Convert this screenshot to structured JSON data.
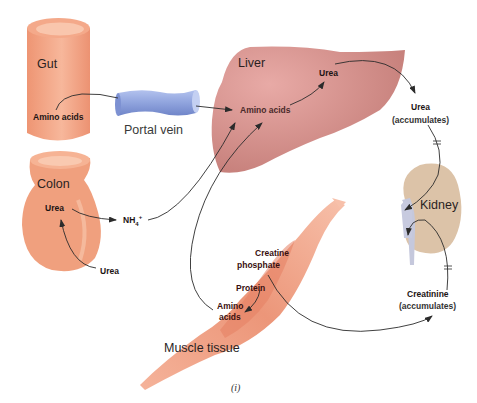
{
  "organs": {
    "gut": "Gut",
    "colon": "Colon",
    "liver": "Liver",
    "kidney": "Kidney",
    "muscle": "Muscle tissue",
    "portal_vein": "Portal vein"
  },
  "labels": {
    "gut_amino_acids": "Amino acids",
    "colon_urea": "Urea",
    "urea_to_colon": "Urea",
    "ammonium": "NH",
    "ammonium_sub": "4",
    "ammonium_sup": "+",
    "liver_amino_acids": "Amino acids",
    "liver_urea": "Urea",
    "urea_accumulates_1": "Urea",
    "urea_accumulates_2": "(accumulates)",
    "creatine_phosphate_1": "Creatine",
    "creatine_phosphate_2": "phosphate",
    "protein": "Protein",
    "muscle_amino_1": "Amino",
    "muscle_amino_2": "acids",
    "creatinine_1": "Creatinine",
    "creatinine_2": "(accumulates)"
  },
  "caption": "(i)",
  "colors": {
    "gut": "#f2a281",
    "colon": "#f0a07e",
    "liver": "#cf8a85",
    "kidney": "#dcc3a8",
    "portal_vein": "#8fa3dd",
    "muscle": "#f0a58a",
    "arrow": "#2b2b2b"
  }
}
